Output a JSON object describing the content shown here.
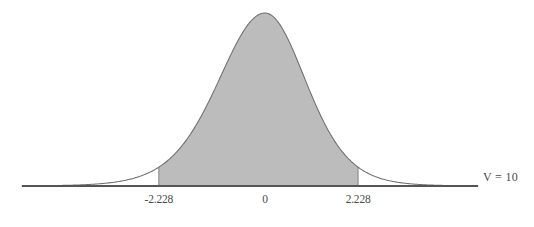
{
  "chart_data": {
    "type": "area",
    "title": "",
    "subtitle": "",
    "xlabel": "",
    "ylabel": "",
    "distribution": "students-t",
    "degrees_of_freedom": 10,
    "annotation": "V = 10",
    "annotation_symbol": "V",
    "annotation_equals": "=",
    "annotation_value": "10",
    "grid": false,
    "legend": false,
    "axis_line": true,
    "xlim": [
      -5.1,
      5.1
    ],
    "ylim": [
      0,
      0.4
    ],
    "tick_values": [
      -2.228,
      0,
      2.228
    ],
    "tick_labels": [
      "-2.228",
      "0",
      "2.228"
    ],
    "shaded_interval": [
      -2.228,
      2.228
    ],
    "shaded_area_probability": 0.95,
    "tail_area_probability": 0.05,
    "curve_color": "#6e6e6e",
    "fill_color": "#bcbcbc",
    "fill_edge_color": "#8a8a8a",
    "axis_color": "#555555",
    "text_color": "#4a4a4a",
    "background_color": "#ffffff",
    "x": [
      -5.1,
      -4.8,
      -4.5,
      -4.2,
      -3.9,
      -3.6,
      -3.3,
      -3.0,
      -2.7,
      -2.4,
      -2.228,
      -2.1,
      -1.8,
      -1.5,
      -1.2,
      -0.9,
      -0.6,
      -0.3,
      0,
      0.3,
      0.6,
      0.9,
      1.2,
      1.5,
      1.8,
      2.1,
      2.228,
      2.4,
      2.7,
      3.0,
      3.3,
      3.6,
      3.9,
      4.2,
      4.5,
      4.8,
      5.1
    ],
    "y": [
      0.0012,
      0.0017,
      0.0024,
      0.0035,
      0.0051,
      0.0077,
      0.0119,
      0.0187,
      0.0301,
      0.0493,
      0.0616,
      0.0812,
      0.1323,
      0.201,
      0.2772,
      0.3422,
      0.3817,
      0.3925,
      0.3891,
      0.3925,
      0.3817,
      0.3422,
      0.2772,
      0.201,
      0.1323,
      0.0812,
      0.0616,
      0.0493,
      0.0301,
      0.0187,
      0.0119,
      0.0077,
      0.0051,
      0.0035,
      0.0024,
      0.0017,
      0.0012
    ]
  },
  "ticks": [
    {
      "label": "-2.228",
      "value": -2.228
    },
    {
      "label": "0",
      "value": 0
    },
    {
      "label": "2.228",
      "value": 2.228
    }
  ]
}
